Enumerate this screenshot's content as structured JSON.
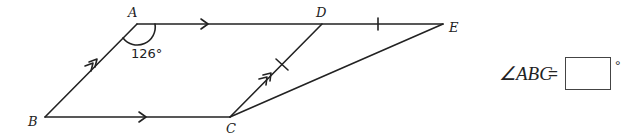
{
  "diagram": {
    "points": {
      "A": {
        "label": "A",
        "x": 137,
        "y": 24
      },
      "B": {
        "label": "B",
        "x": 45,
        "y": 117
      },
      "C": {
        "label": "C",
        "x": 230,
        "y": 117
      },
      "D": {
        "label": "D",
        "x": 322,
        "y": 24
      },
      "E": {
        "label": "E",
        "x": 443,
        "y": 24
      }
    },
    "segments": [
      "AD",
      "DE",
      "AB",
      "BC",
      "CD",
      "CE"
    ],
    "parallel_marks": {
      "single_arrow": [
        "AD",
        "BC"
      ],
      "double_arrow": [
        "AB",
        "CD"
      ]
    },
    "equal_marks": {
      "single_tick": [
        "DE",
        "CD"
      ]
    },
    "angle_label": "126°"
  },
  "question": {
    "prefix": "∠ABC",
    "equals": "=",
    "answer_value": "",
    "unit": "°"
  }
}
